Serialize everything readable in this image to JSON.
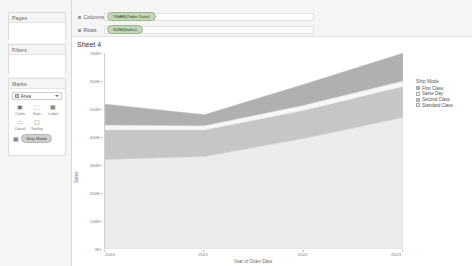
{
  "left_pane": {
    "pages": {
      "title": "Pages"
    },
    "filters": {
      "title": "Filters"
    },
    "marks": {
      "title": "Marks",
      "type_selected": "Area",
      "buttons": [
        {
          "label": "Color",
          "icon": "color-icon",
          "glyph": "▣"
        },
        {
          "label": "Size",
          "icon": "size-icon",
          "glyph": "⬚"
        },
        {
          "label": "Label",
          "icon": "label-icon",
          "glyph": "▦"
        },
        {
          "label": "Detail",
          "icon": "detail-icon",
          "glyph": "∴"
        },
        {
          "label": "Tooltip",
          "icon": "tooltip-icon",
          "glyph": "▢"
        }
      ],
      "shelf_pill": "Ship Mode"
    }
  },
  "shelves": {
    "columns": {
      "label": "Columns",
      "pill": "YEAR(Order Date)"
    },
    "rows": {
      "label": "Rows",
      "pill": "SUM(Sales)"
    }
  },
  "view": {
    "sheet_title": "Sheet 4"
  },
  "legend": {
    "title": "Ship Mode",
    "items": [
      {
        "label": "First Class",
        "color": "#b0b0b0"
      },
      {
        "label": "Same Day",
        "color": "#f2f2f2"
      },
      {
        "label": "Second Class",
        "color": "#c6c6c6"
      },
      {
        "label": "Standard Class",
        "color": "#ececec"
      }
    ]
  },
  "chart_data": {
    "type": "area",
    "title": "Sheet 4",
    "xlabel": "Year of Order Date",
    "ylabel": "Sales",
    "categories": [
      "2020",
      "2021",
      "2022",
      "2023"
    ],
    "x": [
      2020,
      2021,
      2022,
      2023
    ],
    "ylim": [
      0,
      700000
    ],
    "yticks": [
      0,
      100000,
      200000,
      300000,
      400000,
      500000,
      600000,
      700000
    ],
    "ytick_labels": [
      "0K",
      "100K",
      "200K",
      "300K",
      "400K",
      "500K",
      "600K",
      "700K"
    ],
    "grid": false,
    "stacked": true,
    "legend_position": "right",
    "series": [
      {
        "name": "Standard Class",
        "color": "#ececec",
        "values": [
          320000,
          330000,
          395000,
          470000
        ]
      },
      {
        "name": "Second Class",
        "color": "#c6c6c6",
        "values": [
          105000,
          95000,
          100000,
          110000
        ]
      },
      {
        "name": "Same Day",
        "color": "#f7f7f7",
        "values": [
          18000,
          15000,
          18000,
          20000
        ]
      },
      {
        "name": "First Class",
        "color": "#b0b0b0",
        "values": [
          75000,
          40000,
          75000,
          100000
        ]
      }
    ]
  }
}
